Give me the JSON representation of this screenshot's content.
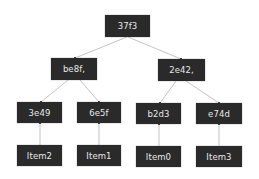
{
  "diagram": {
    "type": "merkle-tree",
    "root": {
      "id": "root",
      "label": "37f3"
    },
    "level1": [
      {
        "id": "l1-left",
        "label": "be8f,"
      },
      {
        "id": "l1-right",
        "label": "2e42,"
      }
    ],
    "level2": [
      {
        "id": "h0",
        "label": "3e49"
      },
      {
        "id": "h1",
        "label": "6e5f"
      },
      {
        "id": "h2",
        "label": "b2d3"
      },
      {
        "id": "h3",
        "label": "e74d"
      }
    ],
    "leaves": [
      {
        "id": "leaf0",
        "label": "Item2"
      },
      {
        "id": "leaf1",
        "label": "Item1"
      },
      {
        "id": "leaf2",
        "label": "Item0"
      },
      {
        "id": "leaf3",
        "label": "Item3"
      }
    ],
    "edges": [
      [
        "l1-left",
        "root"
      ],
      [
        "l1-right",
        "root"
      ],
      [
        "h0",
        "l1-left"
      ],
      [
        "h1",
        "l1-left"
      ],
      [
        "h2",
        "l1-right"
      ],
      [
        "h3",
        "l1-right"
      ],
      [
        "leaf0",
        "h0"
      ],
      [
        "leaf1",
        "h1"
      ],
      [
        "leaf2",
        "h2"
      ],
      [
        "leaf3",
        "h3"
      ]
    ],
    "colors": {
      "node_fill": "#2a2a2a",
      "node_text": "#e8e8e8",
      "edge": "#b0b0b0"
    }
  }
}
